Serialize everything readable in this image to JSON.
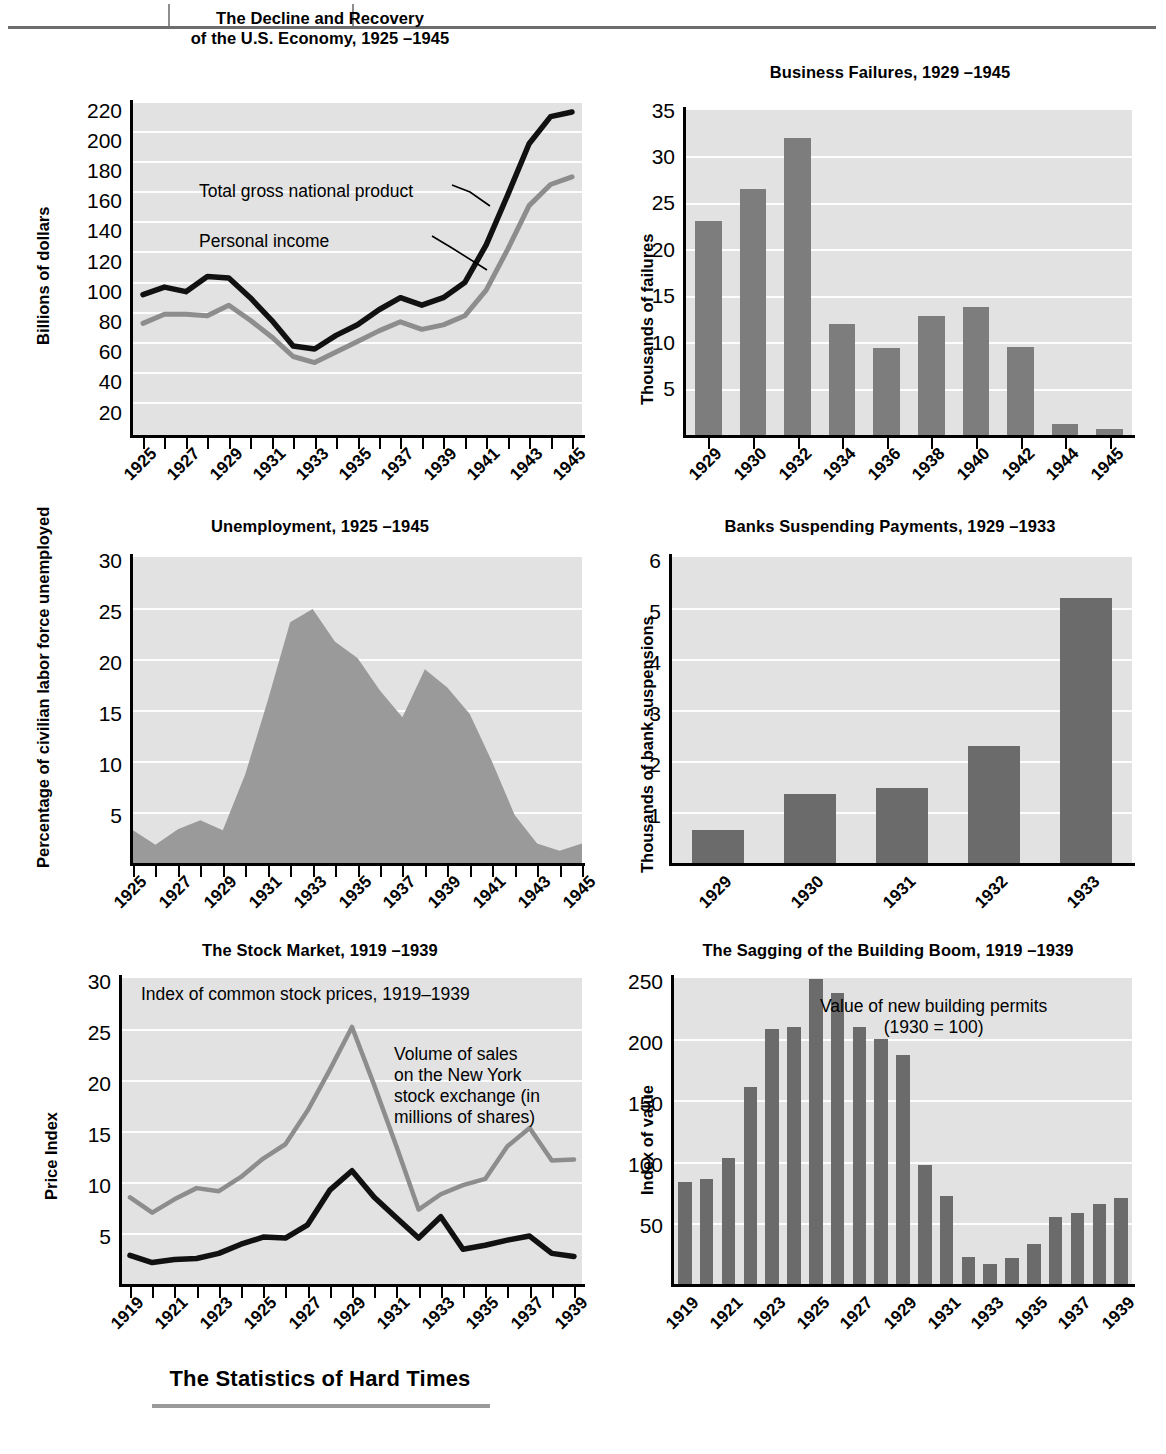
{
  "page": {
    "caption": "The Statistics of Hard Times"
  },
  "charts": [
    {
      "id": "gnp",
      "title_line1": "The Decline and Recovery",
      "title_line2": "of the U.S. Economy, 1925 –1945",
      "ylabel": "Billions of dollars",
      "yticks": [
        "220",
        "200",
        "180",
        "160",
        "140",
        "120",
        "100",
        "80",
        "60",
        "40",
        "20"
      ],
      "xticklabels": [
        "1925",
        "1927",
        "1929",
        "1931",
        "1933",
        "1935",
        "1937",
        "1939",
        "1941",
        "1943",
        "1945"
      ],
      "annotations": [
        "Total gross national product",
        "Personal income"
      ]
    },
    {
      "id": "failures",
      "title_line1": "Business Failures, 1929 –1945",
      "title_line2": "",
      "ylabel": "Thousands of failures",
      "yticks": [
        "35",
        "30",
        "25",
        "20",
        "15",
        "10",
        "5"
      ],
      "xticklabels": [
        "1929",
        "1930",
        "1932",
        "1934",
        "1936",
        "1938",
        "1940",
        "1942",
        "1944",
        "1945"
      ],
      "annotations": []
    },
    {
      "id": "unemployment",
      "title_line1": "Unemployment, 1925 –1945",
      "title_line2": "",
      "ylabel": "Percentage of civilian labor force unemployed",
      "yticks": [
        "30",
        "25",
        "20",
        "15",
        "10",
        "5"
      ],
      "xticklabels": [
        "1925",
        "1927",
        "1929",
        "1931",
        "1933",
        "1935",
        "1937",
        "1939",
        "1941",
        "1943",
        "1945"
      ],
      "annotations": []
    },
    {
      "id": "banks",
      "title_line1": "Banks Suspending Payments, 1929 –1933",
      "title_line2": "",
      "ylabel": "Thousands of bank suspensions",
      "yticks": [
        "6",
        "5",
        "4",
        "3",
        "2",
        "1"
      ],
      "xticklabels": [
        "1929",
        "1930",
        "1931",
        "1932",
        "1933"
      ],
      "annotations": []
    },
    {
      "id": "stocks",
      "title_line1": "The Stock Market, 1919 –1939",
      "title_line2": "",
      "ylabel": "Price Index",
      "yticks": [
        "30",
        "25",
        "20",
        "15",
        "10",
        "5"
      ],
      "xticklabels": [
        "1919",
        "1921",
        "1923",
        "1925",
        "1927",
        "1929",
        "1931",
        "1933",
        "1935",
        "1937",
        "1939"
      ],
      "annotations": [
        "Index of common stock prices, 1919–1939",
        "Volume of sales\non the New York\nstock exchange (in\nmillions of shares)"
      ]
    },
    {
      "id": "building",
      "title_line1": "The Sagging of the Building Boom, 1919 –1939",
      "title_line2": "",
      "ylabel": "Index of value",
      "yticks": [
        "250",
        "200",
        "150",
        "100",
        "50"
      ],
      "xticklabels": [
        "1919",
        "1921",
        "1923",
        "1925",
        "1927",
        "1929",
        "1931",
        "1933",
        "1935",
        "1937",
        "1939"
      ],
      "annotations": [
        "Value of new building permits\n(1930 = 100)"
      ]
    }
  ],
  "chart_data": [
    {
      "type": "line",
      "title": "The Decline and Recovery of the U.S. Economy, 1925 –1945",
      "xlabel": "",
      "ylabel": "Billions of dollars",
      "ylim": [
        0,
        220
      ],
      "grid": true,
      "legend": "inline-annotations",
      "x": [
        1925,
        1926,
        1927,
        1928,
        1929,
        1930,
        1931,
        1932,
        1933,
        1934,
        1935,
        1936,
        1937,
        1938,
        1939,
        1940,
        1941,
        1942,
        1943,
        1944,
        1945
      ],
      "series": [
        {
          "name": "Total gross national product",
          "color": "#111111",
          "values": [
            93,
            98,
            95,
            105,
            104,
            91,
            76,
            59,
            57,
            66,
            73,
            83,
            91,
            86,
            91,
            101,
            126,
            159,
            193,
            211,
            214
          ]
        },
        {
          "name": "Personal income",
          "color": "#8d8d8d",
          "values": [
            74,
            80,
            80,
            79,
            86,
            76,
            65,
            52,
            48,
            55,
            62,
            69,
            75,
            70,
            73,
            79,
            96,
            123,
            152,
            166,
            171
          ]
        }
      ]
    },
    {
      "type": "bar",
      "title": "Business Failures, 1929 –1945",
      "xlabel": "",
      "ylabel": "Thousands of failures",
      "ylim": [
        0,
        35
      ],
      "grid": true,
      "categories": [
        "1929",
        "1930",
        "1932",
        "1934",
        "1936",
        "1938",
        "1940",
        "1942",
        "1944",
        "1945"
      ],
      "values": [
        23.1,
        26.5,
        32.0,
        12.0,
        9.4,
        12.8,
        13.8,
        9.5,
        1.2,
        0.6
      ]
    },
    {
      "type": "area",
      "title": "Unemployment, 1925 –1945",
      "xlabel": "",
      "ylabel": "Percentage of civilian labor force unemployed",
      "ylim": [
        0,
        30
      ],
      "grid": true,
      "x": [
        1925,
        1926,
        1927,
        1928,
        1929,
        1930,
        1931,
        1932,
        1933,
        1934,
        1935,
        1936,
        1937,
        1938,
        1939,
        1940,
        1941,
        1942,
        1943,
        1944,
        1945
      ],
      "values": [
        3.2,
        1.8,
        3.3,
        4.2,
        3.2,
        8.7,
        15.9,
        23.6,
        24.9,
        21.7,
        20.1,
        16.9,
        14.3,
        19.0,
        17.2,
        14.6,
        9.9,
        4.7,
        1.9,
        1.2,
        1.9
      ]
    },
    {
      "type": "bar",
      "title": "Banks Suspending Payments, 1929 –1933",
      "xlabel": "",
      "ylabel": "Thousands of bank suspensions",
      "ylim": [
        0,
        6
      ],
      "grid": true,
      "categories": [
        "1929",
        "1930",
        "1931",
        "1932",
        "1933"
      ],
      "values": [
        0.65,
        1.35,
        1.47,
        2.3,
        5.2
      ]
    },
    {
      "type": "line",
      "title": "The Stock Market, 1919 –1939",
      "xlabel": "",
      "ylabel": "Price Index",
      "ylim": [
        0,
        30
      ],
      "grid": true,
      "x": [
        1919,
        1920,
        1921,
        1922,
        1923,
        1924,
        1925,
        1926,
        1927,
        1928,
        1929,
        1930,
        1931,
        1932,
        1933,
        1934,
        1935,
        1936,
        1937,
        1938,
        1939
      ],
      "series": [
        {
          "name": "Index of common stock prices, 1919–1939",
          "color": "#8d8d8d",
          "values": [
            8.5,
            7.0,
            8.3,
            9.4,
            9.1,
            10.5,
            12.3,
            13.7,
            17.0,
            21.0,
            25.2,
            19.5,
            13.5,
            7.3,
            8.8,
            9.7,
            10.3,
            13.5,
            15.3,
            12.1,
            12.2
          ]
        },
        {
          "name": "Volume of sales on the New York stock exchange (in millions of shares)",
          "color": "#111111",
          "values": [
            2.8,
            2.1,
            2.4,
            2.5,
            3.0,
            3.9,
            4.6,
            4.5,
            5.8,
            9.2,
            11.1,
            8.5,
            6.5,
            4.5,
            6.6,
            3.4,
            3.8,
            4.3,
            4.7,
            3.0,
            2.7
          ]
        }
      ]
    },
    {
      "type": "bar",
      "title": "The Sagging of the Building Boom, 1919 –1939",
      "xlabel": "",
      "ylabel": "Index of value",
      "ylim": [
        0,
        250
      ],
      "grid": true,
      "categories": [
        "1919",
        "1920",
        "1921",
        "1922",
        "1923",
        "1924",
        "1925",
        "1926",
        "1927",
        "1928",
        "1929",
        "1930",
        "1931",
        "1932",
        "1933",
        "1934",
        "1935",
        "1936",
        "1937",
        "1938",
        "1939"
      ],
      "values": [
        83,
        86,
        103,
        161,
        208,
        210,
        249,
        238,
        210,
        200,
        187,
        97,
        72,
        22,
        16,
        21,
        33,
        55,
        58,
        65,
        70
      ]
    }
  ],
  "colors": {
    "plot_background": "#e2e2e2",
    "gridline": "#fdfdfd",
    "bar_fill": "#7d7d7d",
    "bar_fill_dark": "#6b6b6b",
    "area_fill": "#9a9a9a",
    "line_dark": "#111111",
    "line_gray": "#8d8d8d",
    "caption_rule": "#9a9a9a"
  }
}
